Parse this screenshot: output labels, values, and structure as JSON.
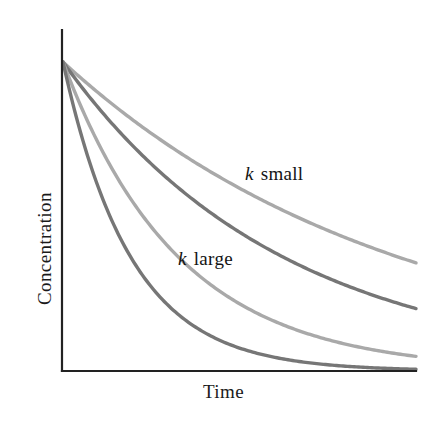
{
  "figure": {
    "background": "#ffffff",
    "width": 436,
    "height": 423
  },
  "axes": {
    "x_title": "Time",
    "y_title": "Concentration",
    "axis_color": "#222222",
    "x_axis": {
      "x1": 62,
      "y1": 371,
      "x2": 416,
      "y2": 371
    },
    "y_axis": {
      "x1": 62,
      "y1": 30,
      "x2": 62,
      "y2": 371
    }
  },
  "annotations": [
    {
      "name": "k-small",
      "symbol": "k",
      "text": " small",
      "x": 245,
      "y": 163
    },
    {
      "name": "k-large",
      "symbol": "k",
      "text": " large",
      "x": 178,
      "y": 248
    }
  ],
  "colors": {
    "light_gray": "#a9a9a9",
    "dark_gray": "#767676",
    "axis_black": "#222222",
    "text_black": "#141414"
  },
  "chart_data": {
    "type": "line",
    "title": "",
    "xlabel": "Time",
    "ylabel": "Concentration",
    "xlim": [
      0,
      1
    ],
    "ylim": [
      0,
      1
    ],
    "grid": false,
    "axis_ticks": false,
    "legend": "inline-annotations",
    "x": [
      0,
      0.1,
      0.2,
      0.3,
      0.4,
      0.5,
      0.6,
      0.7,
      0.8,
      0.9,
      1
    ],
    "series": [
      {
        "name": "k smallest",
        "color": "#a9a9a9",
        "k": 1.05,
        "values": [
          1.0,
          0.9,
          0.81,
          0.73,
          0.656,
          0.591,
          0.532,
          0.479,
          0.431,
          0.388,
          0.35
        ]
      },
      {
        "name": "k small",
        "color": "#767676",
        "k": 1.6,
        "values": [
          1.0,
          0.852,
          0.726,
          0.619,
          0.527,
          0.449,
          0.383,
          0.326,
          0.278,
          0.237,
          0.202
        ]
      },
      {
        "name": "k large",
        "color": "#a9a9a9",
        "k": 3.05,
        "values": [
          1.0,
          0.737,
          0.543,
          0.4,
          0.295,
          0.218,
          0.16,
          0.118,
          0.087,
          0.064,
          0.047
        ]
      },
      {
        "name": "k largest",
        "color": "#767676",
        "k": 5.2,
        "values": [
          1.0,
          0.595,
          0.354,
          0.21,
          0.125,
          0.074,
          0.044,
          0.026,
          0.016,
          0.009,
          0.006
        ]
      }
    ]
  }
}
